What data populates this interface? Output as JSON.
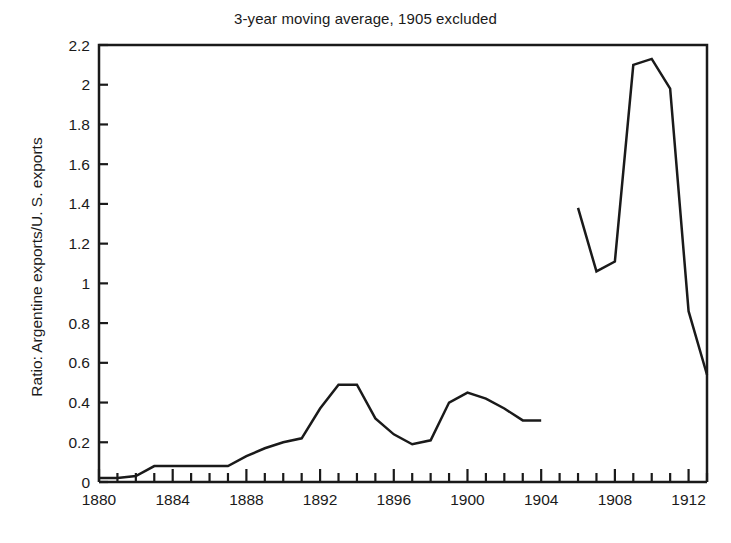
{
  "chart_data": {
    "type": "line",
    "title": "3-year moving average, 1905 excluded",
    "xlabel": "",
    "ylabel": "Ratio: Argentine exports/U. S. exports",
    "xlim": [
      1880,
      1913
    ],
    "ylim": [
      0,
      2.2
    ],
    "grid": false,
    "legend": null,
    "y_ticks": [
      0,
      0.2,
      0.4,
      0.6,
      0.8,
      1,
      1.2,
      1.4,
      1.6,
      1.8,
      2,
      2.2
    ],
    "y_tick_labels": [
      "0",
      "0.2",
      "0.4",
      "0.6",
      "0.8",
      "1",
      "1.2",
      "1.4",
      "1.6",
      "1.8",
      "2",
      "2.2"
    ],
    "x_ticks_major": [
      1880,
      1884,
      1888,
      1892,
      1896,
      1900,
      1904,
      1908,
      1912
    ],
    "x_tick_labels": [
      "1880",
      "1884",
      "1888",
      "1892",
      "1896",
      "1900",
      "1904",
      "1908",
      "1912"
    ],
    "x_minor_tick_step": 1,
    "line_color": "#1a1a1a",
    "line_width": 2.5,
    "series": [
      {
        "name": "Ratio: Argentine exports/U. S. exports",
        "note": "segment 1, 1880-1904",
        "x": [
          1880,
          1881,
          1882,
          1883,
          1884,
          1885,
          1886,
          1887,
          1888,
          1889,
          1890,
          1891,
          1892,
          1893,
          1894,
          1895,
          1896,
          1897,
          1898,
          1899,
          1900,
          1901,
          1902,
          1903,
          1904
        ],
        "values": [
          0.02,
          0.02,
          0.03,
          0.08,
          0.08,
          0.08,
          0.08,
          0.08,
          0.13,
          0.17,
          0.2,
          0.22,
          0.37,
          0.49,
          0.49,
          0.32,
          0.24,
          0.19,
          0.21,
          0.4,
          0.45,
          0.42,
          0.37,
          0.31,
          0.31
        ]
      },
      {
        "name": "Ratio: Argentine exports/U. S. exports",
        "note": "segment 2, 1906-1913",
        "x": [
          1906,
          1907,
          1908,
          1909,
          1910,
          1911,
          1912,
          1913
        ],
        "values": [
          1.38,
          1.06,
          1.11,
          2.1,
          2.13,
          1.98,
          0.86,
          0.54
        ]
      }
    ],
    "break_note": "1905 excluded: line is broken between 1904 and 1906"
  }
}
